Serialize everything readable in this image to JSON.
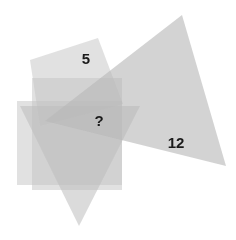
{
  "canvas": {
    "width": 236,
    "height": 240,
    "background": "#ffffff"
  },
  "diagram": {
    "kind": "overlapping-translucent-polygons",
    "shapes": [
      {
        "name": "quadrilateral-top-left",
        "type": "polygon",
        "fill": "#c9c9c9",
        "opacity": 0.55,
        "points": "30,60 98,38 123,104 40,126"
      },
      {
        "name": "rectangle-outer",
        "type": "rect",
        "fill": "#c4c4c4",
        "opacity": 0.5,
        "x": 17,
        "y": 101,
        "width": 105,
        "height": 84
      },
      {
        "name": "rectangle-inner",
        "type": "rect",
        "fill": "#c4c4c4",
        "opacity": 0.5,
        "x": 32,
        "y": 78,
        "width": 90,
        "height": 112
      },
      {
        "name": "triangle-down",
        "type": "polygon",
        "fill": "#bdbdbd",
        "opacity": 0.55,
        "points": "20,106 140,106 79,226"
      },
      {
        "name": "triangle-large-right",
        "type": "polygon",
        "fill": "#b8b8b8",
        "opacity": 0.62,
        "points": "182,15 226,166 45,121"
      }
    ],
    "labels": [
      {
        "name": "label-five",
        "text": "5",
        "x": 86,
        "y": 60,
        "font_size": 15
      },
      {
        "name": "label-unknown",
        "text": "?",
        "x": 99,
        "y": 122,
        "font_size": 15
      },
      {
        "name": "label-twelve",
        "text": "12",
        "x": 176,
        "y": 144,
        "font_size": 15
      }
    ],
    "colors": {
      "background": "#ffffff",
      "shape_light": "#d5d5d5",
      "shape_mid": "#c0c0c0",
      "shape_dark_overlap": "#9a9a9a",
      "label_text": "#1a1a1a"
    }
  }
}
